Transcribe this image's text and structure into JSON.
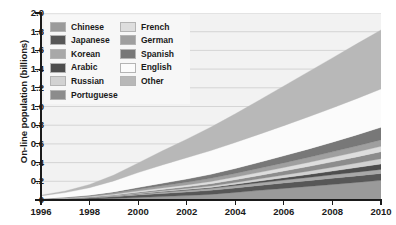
{
  "chart_data": {
    "type": "area",
    "stacked": true,
    "title": "",
    "xlabel": "",
    "ylabel": "On-line population (billions)",
    "xlim": [
      1996,
      2010
    ],
    "ylim": [
      0,
      2.0
    ],
    "grid": true,
    "legend_position": "top-left",
    "x": [
      1996,
      1997,
      1998,
      1999,
      2000,
      2001,
      2002,
      2003,
      2004,
      2005,
      2006,
      2007,
      2008,
      2009,
      2010
    ],
    "xticks": [
      "1996",
      "1998",
      "2000",
      "2002",
      "2004",
      "2006",
      "2008",
      "2010"
    ],
    "yticks": [
      "0",
      "0.2",
      "0.4",
      "0.6",
      "0.8",
      "1.0",
      "1.2",
      "1.4",
      "1.6",
      "1.8",
      "2.0"
    ],
    "series": [
      {
        "name": "Chinese",
        "color": "#9a9a9a",
        "values": [
          0.002,
          0.004,
          0.008,
          0.016,
          0.027,
          0.037,
          0.047,
          0.06,
          0.081,
          0.103,
          0.124,
          0.145,
          0.166,
          0.188,
          0.21
        ]
      },
      {
        "name": "Japanese",
        "color": "#575757",
        "values": [
          0.004,
          0.008,
          0.013,
          0.019,
          0.027,
          0.033,
          0.038,
          0.043,
          0.048,
          0.053,
          0.058,
          0.062,
          0.066,
          0.07,
          0.074
        ]
      },
      {
        "name": "Korean",
        "color": "#a8a8a8",
        "values": [
          0.001,
          0.002,
          0.004,
          0.007,
          0.011,
          0.015,
          0.019,
          0.022,
          0.025,
          0.028,
          0.031,
          0.034,
          0.037,
          0.04,
          0.043
        ]
      },
      {
        "name": "Arabic",
        "color": "#4e4e4e",
        "values": [
          0.0,
          0.001,
          0.001,
          0.002,
          0.003,
          0.005,
          0.007,
          0.01,
          0.014,
          0.019,
          0.025,
          0.032,
          0.04,
          0.049,
          0.059
        ]
      },
      {
        "name": "Russian",
        "color": "#d2d2d2",
        "values": [
          0.0,
          0.001,
          0.002,
          0.003,
          0.005,
          0.008,
          0.011,
          0.015,
          0.019,
          0.024,
          0.029,
          0.035,
          0.041,
          0.048,
          0.055
        ]
      },
      {
        "name": "Portuguese",
        "color": "#8c8c8c",
        "values": [
          0.001,
          0.002,
          0.004,
          0.007,
          0.011,
          0.015,
          0.019,
          0.024,
          0.03,
          0.036,
          0.043,
          0.05,
          0.058,
          0.066,
          0.075
        ]
      },
      {
        "name": "French",
        "color": "#dedede",
        "values": [
          0.002,
          0.003,
          0.005,
          0.008,
          0.012,
          0.016,
          0.02,
          0.024,
          0.028,
          0.033,
          0.038,
          0.043,
          0.048,
          0.053,
          0.058
        ]
      },
      {
        "name": "German",
        "color": "#9f9f9f",
        "values": [
          0.002,
          0.004,
          0.007,
          0.012,
          0.018,
          0.024,
          0.029,
          0.034,
          0.039,
          0.044,
          0.049,
          0.054,
          0.059,
          0.064,
          0.069
        ]
      },
      {
        "name": "Spanish",
        "color": "#787878",
        "values": [
          0.002,
          0.004,
          0.007,
          0.012,
          0.019,
          0.026,
          0.034,
          0.043,
          0.053,
          0.064,
          0.076,
          0.089,
          0.103,
          0.118,
          0.134
        ]
      },
      {
        "name": "English",
        "color": "#fbfbfb",
        "values": [
          0.03,
          0.05,
          0.08,
          0.118,
          0.16,
          0.196,
          0.228,
          0.254,
          0.278,
          0.3,
          0.322,
          0.344,
          0.366,
          0.388,
          0.41
        ]
      },
      {
        "name": "Other",
        "color": "#b8b8b8",
        "values": [
          0.008,
          0.017,
          0.035,
          0.063,
          0.103,
          0.151,
          0.198,
          0.251,
          0.307,
          0.366,
          0.425,
          0.482,
          0.536,
          0.586,
          0.632
        ]
      }
    ]
  },
  "axes": {
    "ylabel": "On-line population (billions)",
    "ytick_labels": [
      "2.0",
      "1.8",
      "1.6",
      "1.4",
      "1.2",
      "1.0",
      "0.8",
      "0.6",
      "0.4",
      "0.2",
      "0"
    ],
    "ytick_values": [
      2.0,
      1.8,
      1.6,
      1.4,
      1.2,
      1.0,
      0.8,
      0.6,
      0.4,
      0.2,
      0
    ],
    "xtick_labels": [
      "1996",
      "1998",
      "2000",
      "2002",
      "2004",
      "2006",
      "2008",
      "2010"
    ],
    "xtick_values": [
      1996,
      1998,
      2000,
      2002,
      2004,
      2006,
      2008,
      2010
    ]
  },
  "legend": {
    "left_column": [
      {
        "label": "Chinese",
        "color": "#9a9a9a"
      },
      {
        "label": "Japanese",
        "color": "#575757"
      },
      {
        "label": "Korean",
        "color": "#a8a8a8"
      },
      {
        "label": "Arabic",
        "color": "#4e4e4e"
      },
      {
        "label": "Russian",
        "color": "#d2d2d2"
      },
      {
        "label": "Portuguese",
        "color": "#8c8c8c"
      }
    ],
    "right_column": [
      {
        "label": "French",
        "color": "#dedede"
      },
      {
        "label": "German",
        "color": "#9f9f9f"
      },
      {
        "label": "Spanish",
        "color": "#787878"
      },
      {
        "label": "English",
        "color": "#fbfbfb"
      },
      {
        "label": "Other",
        "color": "#b8b8b8"
      }
    ]
  },
  "colors": {
    "plot_background": "#f2f2f2",
    "legend_background": "#f7f7f7",
    "gridline": "#c9c9c9",
    "axis": "#1a1a1a",
    "text": "#1a1a1a"
  }
}
